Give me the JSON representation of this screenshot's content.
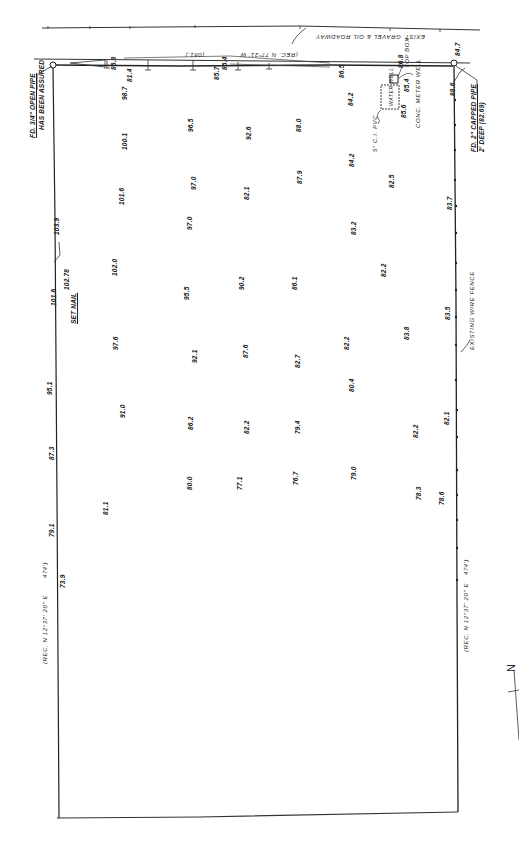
{
  "road": {
    "label": "EXIST. GRAVEL & OIL ROADWAY",
    "bearing_note": "(REC. N 77°21' W",
    "dist_fragment": "(081.)"
  },
  "corners": {
    "top_left": {
      "label_line1": "FD. 3/4\" OPEN PIPE",
      "label_line2": "HAS BEEN ASSURED"
    },
    "top_right": {
      "elev": "84.7",
      "label_line1": "FD. 2\" CAPPED PIPE",
      "label_line2": "2' DEEP (82.69)"
    }
  },
  "left_line": {
    "bearing_note": "(REC. N 12°37' 20\" E",
    "distance": "474')",
    "elevations": [
      "103.9",
      "101.6",
      "95.1",
      "87.3",
      "79.1",
      "73.9"
    ]
  },
  "right_line": {
    "bearing_note": "(REC. N 12°37' 20\" E",
    "distance": "474')",
    "fence_label": "EXISTING WIRE FENCE"
  },
  "set_nail": {
    "label": "SET NAIL",
    "elev": "102.78"
  },
  "utilities": {
    "meter_box_elev": "86.8",
    "meter_box_label": "TOP BOX",
    "meter_well_label": "CONC. METER WELL",
    "well_pit_label": "WATER WELL",
    "well_elev_1": "85.6",
    "well_elev_2": "85.4",
    "pvc_label": "5\" C.I. PVC",
    "pole_elev": "88.6"
  },
  "road_edge_elevs": [
    "86.8",
    "81.4",
    "86.4",
    "85.7",
    "86.5"
  ],
  "grid_elevations": [
    {
      "v": "98.7",
      "x": 121,
      "y": 100
    },
    {
      "v": "96.5",
      "x": 187,
      "y": 132
    },
    {
      "v": "92.6",
      "x": 245,
      "y": 140
    },
    {
      "v": "88.0",
      "x": 295,
      "y": 132
    },
    {
      "v": "84.2",
      "x": 347,
      "y": 106
    },
    {
      "v": "100.1",
      "x": 121,
      "y": 150
    },
    {
      "v": "84.2",
      "x": 348,
      "y": 167
    },
    {
      "v": "101.6",
      "x": 118,
      "y": 205
    },
    {
      "v": "97.0",
      "x": 190,
      "y": 190
    },
    {
      "v": "82.1",
      "x": 243,
      "y": 200
    },
    {
      "v": "87.9",
      "x": 296,
      "y": 184
    },
    {
      "v": "82.5",
      "x": 388,
      "y": 188
    },
    {
      "v": "83.7",
      "x": 446,
      "y": 210
    },
    {
      "v": "97.0",
      "x": 186,
      "y": 230
    },
    {
      "v": "83.2",
      "x": 350,
      "y": 235
    },
    {
      "v": "102.0",
      "x": 111,
      "y": 276
    },
    {
      "v": "95.5",
      "x": 183,
      "y": 300
    },
    {
      "v": "90.2",
      "x": 238,
      "y": 290
    },
    {
      "v": "86.1",
      "x": 291,
      "y": 290
    },
    {
      "v": "82.2",
      "x": 380,
      "y": 277
    },
    {
      "v": "82.2",
      "x": 343,
      "y": 350
    },
    {
      "v": "83.5",
      "x": 444,
      "y": 320
    },
    {
      "v": "83.8",
      "x": 403,
      "y": 340
    },
    {
      "v": "97.6",
      "x": 112,
      "y": 350
    },
    {
      "v": "92.1",
      "x": 191,
      "y": 363
    },
    {
      "v": "87.6",
      "x": 242,
      "y": 358
    },
    {
      "v": "82.7",
      "x": 294,
      "y": 368
    },
    {
      "v": "80.4",
      "x": 348,
      "y": 392
    },
    {
      "v": "91.0",
      "x": 119,
      "y": 418
    },
    {
      "v": "86.2",
      "x": 187,
      "y": 430
    },
    {
      "v": "82.2",
      "x": 243,
      "y": 434
    },
    {
      "v": "79.4",
      "x": 294,
      "y": 434
    },
    {
      "v": "82.2",
      "x": 412,
      "y": 438
    },
    {
      "v": "82.1",
      "x": 443,
      "y": 425
    },
    {
      "v": "79.0",
      "x": 350,
      "y": 480
    },
    {
      "v": "80.0",
      "x": 186,
      "y": 490
    },
    {
      "v": "77.1",
      "x": 236,
      "y": 490
    },
    {
      "v": "76.7",
      "x": 292,
      "y": 485
    },
    {
      "v": "81.1",
      "x": 102,
      "y": 515
    },
    {
      "v": "78.3",
      "x": 415,
      "y": 500
    },
    {
      "v": "78.6",
      "x": 438,
      "y": 505
    }
  ],
  "north_arrow": {
    "label": "N"
  }
}
